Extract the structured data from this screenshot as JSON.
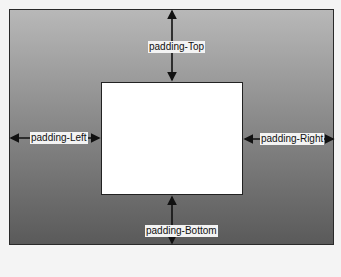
{
  "diagram": {
    "title": "",
    "labels": {
      "top": "padding-Top",
      "left": "padding-Left",
      "right": "padding-Right",
      "bottom": "padding-Bottom"
    },
    "colors": {
      "outer_gradient_top": "#b8b8b8",
      "outer_gradient_bottom": "#5a5a5a",
      "inner_fill": "#ffffff",
      "arrow": "#111111"
    }
  }
}
